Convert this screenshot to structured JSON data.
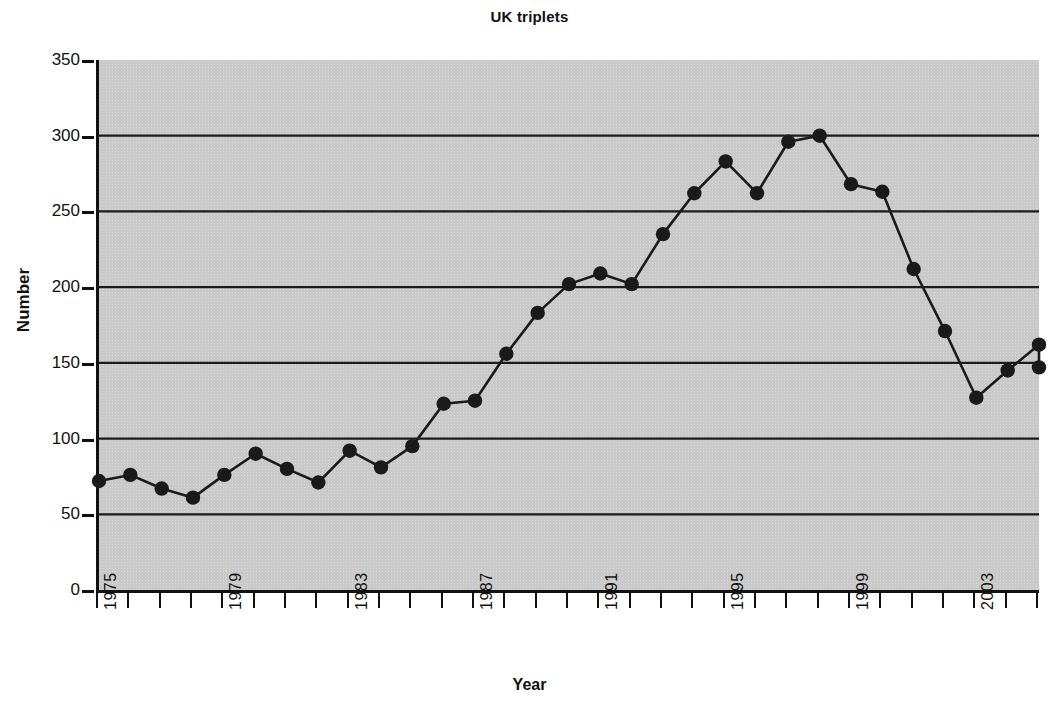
{
  "chart_data": {
    "type": "line",
    "title": "UK triplets",
    "xlabel": "Year",
    "ylabel": "Number",
    "grid": true,
    "legend": false,
    "xlim": [
      1975,
      2005
    ],
    "ylim": [
      0,
      350
    ],
    "ytick_labels": [
      "350",
      "300",
      "250",
      "200",
      "150",
      "100",
      "50",
      "0"
    ],
    "ytick_values": [
      350,
      300,
      250,
      200,
      150,
      100,
      50,
      0
    ],
    "ytick_step": 50,
    "xtick_labels": [
      "1975",
      "1979",
      "1983",
      "1987",
      "1991",
      "1995",
      "1999",
      "2003"
    ],
    "xtick_values": [
      1975,
      1979,
      1983,
      1987,
      1991,
      1995,
      1999,
      2003
    ],
    "xtick_step": 4,
    "marker": "filled-circle",
    "line_color": "#1a1a1a",
    "marker_color": "#1a1a1a",
    "plot_background": "#c9c9c9",
    "figure_background": "#ffffff",
    "x": [
      1975,
      1976,
      1977,
      1978,
      1979,
      1980,
      1981,
      1982,
      1983,
      1984,
      1985,
      1986,
      1987,
      1988,
      1989,
      1990,
      1991,
      1992,
      1993,
      1994,
      1995,
      1996,
      1997,
      1998,
      1999,
      2000,
      2001,
      2002,
      2003,
      2004,
      2005
    ],
    "values": [
      72,
      76,
      67,
      61,
      76,
      90,
      80,
      71,
      92,
      81,
      95,
      123,
      125,
      156,
      183,
      202,
      209,
      202,
      235,
      262,
      283,
      262,
      296,
      300,
      268,
      263,
      212,
      171,
      127,
      145,
      162
    ],
    "last_value": 147,
    "series": [
      {
        "name": "UK triplets",
        "x": [
          1975,
          1976,
          1977,
          1978,
          1979,
          1980,
          1981,
          1982,
          1983,
          1984,
          1985,
          1986,
          1987,
          1988,
          1989,
          1990,
          1991,
          1992,
          1993,
          1994,
          1995,
          1996,
          1997,
          1998,
          1999,
          2000,
          2001,
          2002,
          2003,
          2004,
          2005
        ],
        "values": [
          72,
          76,
          67,
          61,
          76,
          90,
          80,
          71,
          92,
          81,
          95,
          123,
          125,
          156,
          183,
          202,
          209,
          202,
          235,
          262,
          283,
          262,
          296,
          300,
          268,
          263,
          212,
          171,
          127,
          145,
          162
        ]
      }
    ]
  }
}
